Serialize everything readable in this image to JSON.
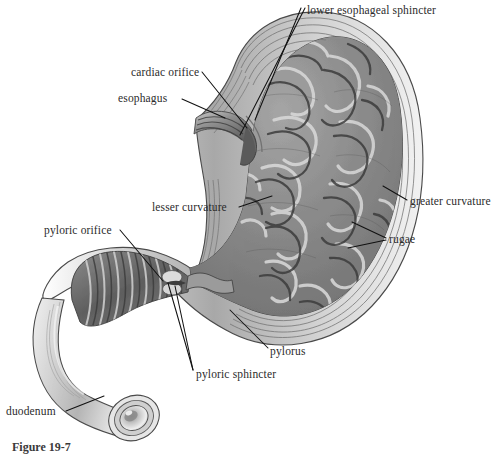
{
  "figure": {
    "caption": "Figure 19-7",
    "style": "grayscale-pencil-illustration",
    "background_color": "#ffffff",
    "ink_color": "#111111",
    "label_color": "#2b2b2b"
  },
  "labels": [
    {
      "id": "lower-esophageal-sphincter",
      "text": "lower esophageal sphincter",
      "x": 307,
      "y": 4,
      "anchor": "left"
    },
    {
      "id": "cardiac-orifice",
      "text": "cardiac orifice",
      "x": 131,
      "y": 66,
      "anchor": "left"
    },
    {
      "id": "esophagus",
      "text": "esophagus",
      "x": 118,
      "y": 92,
      "anchor": "left"
    },
    {
      "id": "lesser-curvature",
      "text": "lesser curvature",
      "x": 152,
      "y": 201,
      "anchor": "left"
    },
    {
      "id": "greater-curvature",
      "text": "greater curvature",
      "x": 410,
      "y": 195,
      "anchor": "left"
    },
    {
      "id": "rugae",
      "text": "rugae",
      "x": 389,
      "y": 233,
      "anchor": "left"
    },
    {
      "id": "pyloric-orifice",
      "text": "pyloric orifice",
      "x": 44,
      "y": 224,
      "anchor": "left"
    },
    {
      "id": "pylorus",
      "text": "pylorus",
      "x": 270,
      "y": 345,
      "anchor": "left"
    },
    {
      "id": "pyloric-sphincter",
      "text": "pyloric sphincter",
      "x": 196,
      "y": 368,
      "anchor": "left"
    },
    {
      "id": "duodenum",
      "text": "duodenum",
      "x": 6,
      "y": 405,
      "anchor": "left"
    }
  ],
  "leader_lines": [
    {
      "id": "leader-les-a",
      "for": "lower-esophageal-sphincter",
      "d": "M305,8 L240,135"
    },
    {
      "id": "leader-les-b",
      "for": "lower-esophageal-sphincter",
      "d": "M301,8 L255,120"
    },
    {
      "id": "leader-cardiac-orifice",
      "for": "cardiac-orifice",
      "d": "M202,72 L247,128"
    },
    {
      "id": "leader-esophagus",
      "for": "esophagus",
      "d": "M182,99 L225,118"
    },
    {
      "id": "leader-lesser-curvature",
      "for": "lesser-curvature",
      "d": "M239,207 L272,196"
    },
    {
      "id": "leader-greater-curvature",
      "for": "greater-curvature",
      "d": "M407,200 L383,186"
    },
    {
      "id": "leader-rugae-a",
      "for": "rugae",
      "d": "M386,238 L352,222"
    },
    {
      "id": "leader-rugae-b",
      "for": "rugae",
      "d": "M386,240 L348,248"
    },
    {
      "id": "leader-pyloric-orifice",
      "for": "pyloric-orifice",
      "d": "M120,230 L163,281"
    },
    {
      "id": "leader-pylorus",
      "for": "pylorus",
      "d": "M268,348 L230,310"
    },
    {
      "id": "leader-pyloric-sphincter-a",
      "for": "pyloric-sphincter",
      "d": "M193,370 L168,283"
    },
    {
      "id": "leader-pyloric-sphincter-b",
      "for": "pyloric-sphincter",
      "d": "M193,370 L175,286"
    },
    {
      "id": "leader-duodenum",
      "for": "duodenum",
      "d": "M66,411 L104,396"
    }
  ],
  "structures": [
    {
      "id": "esophagus",
      "name": "esophagus",
      "region": "upper-left",
      "fill": "#8e8e8e"
    },
    {
      "id": "cardiac-orifice",
      "name": "cardiac orifice",
      "region": "upper-middle",
      "fill": "#6f6f6f"
    },
    {
      "id": "fundus",
      "name": "fundus",
      "region": "upper-right",
      "fill": "#9a9a9a"
    },
    {
      "id": "body",
      "name": "body of stomach",
      "region": "center-right",
      "fill": "#8a8a8a"
    },
    {
      "id": "rugae",
      "name": "rugae (gastric folds)",
      "region": "interior",
      "fill": "#7d7d7d"
    },
    {
      "id": "greater-curvature",
      "name": "greater curvature",
      "region": "right-edge",
      "fill": "#b9b9b9"
    },
    {
      "id": "lesser-curvature",
      "name": "lesser curvature",
      "region": "left-edge",
      "fill": "#bcbcbc"
    },
    {
      "id": "antrum",
      "name": "pyloric antrum",
      "region": "lower-left",
      "fill": "#6b6b6b"
    },
    {
      "id": "pylorus",
      "name": "pylorus",
      "region": "lower-middle",
      "fill": "#777777"
    },
    {
      "id": "pyloric-sphincter",
      "name": "pyloric sphincter",
      "region": "lower-middle",
      "fill": "#c9c9c9"
    },
    {
      "id": "duodenum",
      "name": "duodenum",
      "region": "bottom-left",
      "fill": "#cfcfcf"
    }
  ]
}
